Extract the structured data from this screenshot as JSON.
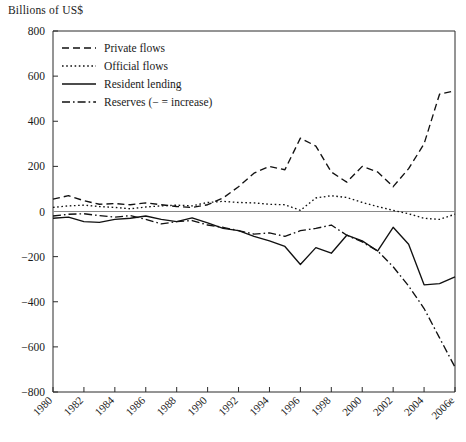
{
  "chart_data": {
    "type": "line",
    "title": "",
    "ylabel": "Billions of US$",
    "xlabel": "",
    "ylim": [
      -800,
      800
    ],
    "yticks": [
      800,
      600,
      400,
      200,
      0,
      -200,
      -400,
      -600,
      -800
    ],
    "ytick_labels": [
      "800",
      "600",
      "400",
      "200",
      "0",
      "−200",
      "−400",
      "−600",
      "−800"
    ],
    "grid": false,
    "legend_position": "top-left",
    "x": [
      1980,
      1981,
      1982,
      1983,
      1984,
      1985,
      1986,
      1987,
      1988,
      1989,
      1990,
      1991,
      1992,
      1993,
      1994,
      1995,
      1996,
      1997,
      1998,
      1999,
      2000,
      2001,
      2002,
      2003,
      2004,
      2005,
      2006
    ],
    "xticks": [
      1980,
      1982,
      1984,
      1986,
      1988,
      1990,
      1992,
      1994,
      1996,
      1998,
      2000,
      2002,
      2004,
      2006
    ],
    "xtick_labels": [
      "1980",
      "1982",
      "1984",
      "1986",
      "1988",
      "1990",
      "1992",
      "1994",
      "1996",
      "1998",
      "2000",
      "2002",
      "2004",
      "2006e"
    ],
    "series": [
      {
        "name": "Private flows",
        "style": "dashed",
        "values": [
          55,
          70,
          48,
          32,
          35,
          30,
          38,
          30,
          22,
          18,
          30,
          60,
          110,
          170,
          200,
          185,
          325,
          290,
          175,
          130,
          200,
          175,
          110,
          190,
          300,
          520,
          535
        ]
      },
      {
        "name": "Official flows",
        "style": "dotted",
        "values": [
          18,
          25,
          28,
          22,
          18,
          12,
          20,
          25,
          28,
          25,
          40,
          45,
          40,
          38,
          32,
          30,
          5,
          60,
          70,
          62,
          40,
          22,
          5,
          -10,
          -30,
          -35,
          -12
        ]
      },
      {
        "name": "Resident lending",
        "style": "solid",
        "values": [
          -30,
          -25,
          -45,
          -48,
          -35,
          -30,
          -20,
          -35,
          -45,
          -28,
          -50,
          -75,
          -85,
          -110,
          -130,
          -155,
          -235,
          -160,
          -185,
          -105,
          -130,
          -175,
          -70,
          -145,
          -325,
          -320,
          -290
        ]
      },
      {
        "name": "Reserves (− = increase)",
        "style": "dash-dot",
        "values": [
          -20,
          -12,
          -10,
          -18,
          -25,
          -18,
          -35,
          -55,
          -45,
          -40,
          -60,
          -70,
          -85,
          -100,
          -95,
          -110,
          -85,
          -75,
          -60,
          -105,
          -135,
          -175,
          -245,
          -330,
          -430,
          -560,
          -690
        ]
      }
    ]
  },
  "legend": {
    "items": [
      {
        "label": "Private flows"
      },
      {
        "label": "Official flows"
      },
      {
        "label": "Resident lending"
      },
      {
        "label": "Reserves (− = increase)"
      }
    ]
  }
}
